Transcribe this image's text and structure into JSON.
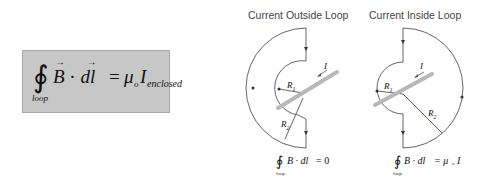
{
  "main_equation": {
    "integral": "∮",
    "lhs": "B · dl",
    "equals": "=",
    "rhs_mu": "μ",
    "rhs_sub_o": "o",
    "rhs_I": "I",
    "rhs_sub": "enclosed",
    "subscript": "loop",
    "box_color": "#c7c7c7"
  },
  "panels": [
    {
      "title": "Current Outside Loop",
      "labels": {
        "current": "I",
        "r1": "R",
        "r1_sub": "1",
        "r2": "R",
        "r2_sub": "2"
      },
      "equation": {
        "integral": "∮",
        "lhs": "B · dl",
        "rhs": "= 0",
        "subscript": "loop"
      }
    },
    {
      "title": "Current Inside Loop",
      "labels": {
        "current": "I",
        "r1": "R",
        "r1_sub": "1",
        "r2": "R",
        "r2_sub": "2"
      },
      "equation": {
        "integral": "∮",
        "lhs": "B · dl",
        "rhs": "= μ",
        "rhs_sub": "o",
        "rhs_I": "I",
        "subscript": "loop"
      }
    }
  ],
  "colors": {
    "wire": "#b8b8b8",
    "loop": "#555555",
    "text": "#444444"
  }
}
